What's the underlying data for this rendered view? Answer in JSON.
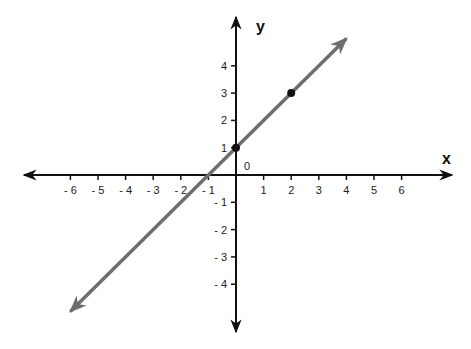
{
  "chart_data": {
    "type": "line",
    "title": "",
    "xlabel": "x",
    "ylabel": "y",
    "origin_label": "0",
    "xlim": [
      -7.5,
      7.5
    ],
    "ylim": [
      -5.5,
      5.5
    ],
    "x_ticks": [
      -6,
      -5,
      -4,
      -3,
      -2,
      -1,
      1,
      2,
      3,
      4,
      5,
      6
    ],
    "x_tick_labels": [
      "- 6",
      "- 5",
      "- 4",
      "- 3",
      "- 2",
      "- 1",
      "1",
      "2",
      "3",
      "4",
      "5",
      "6"
    ],
    "y_ticks": [
      -4,
      -3,
      -2,
      -1,
      1,
      2,
      3,
      4
    ],
    "y_tick_labels": [
      "- 4",
      "- 3",
      "- 2",
      "- 1",
      "1",
      "2",
      "3",
      "4"
    ],
    "grid": false,
    "series": [
      {
        "name": "y = x + 1",
        "equation": "y = x + 1",
        "slope": 1,
        "intercept": 1,
        "line_start": [
          -6,
          -5
        ],
        "line_end": [
          4,
          5
        ],
        "arrows": "both",
        "color": "#6e6e6e"
      }
    ],
    "points": [
      {
        "x": 0,
        "y": 1,
        "label": "(0, 1)"
      },
      {
        "x": 2,
        "y": 3,
        "label": "(2, 3)"
      }
    ],
    "colors": {
      "axes": "#111111",
      "line": "#6e6e6e",
      "points": "#111111"
    }
  }
}
